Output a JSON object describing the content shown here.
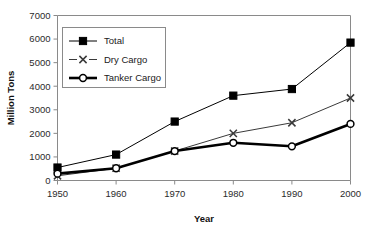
{
  "chart_data": {
    "type": "line",
    "title": "",
    "xlabel": "Year",
    "ylabel": "Million Tons",
    "x": [
      1950,
      1960,
      1970,
      1980,
      1990,
      2000
    ],
    "xticklabels": [
      "1950",
      "1960",
      "1970",
      "1980",
      "1990",
      "2000"
    ],
    "yticklabels": [
      "0",
      "1000",
      "2000",
      "3000",
      "4000",
      "5000",
      "6000",
      "7000"
    ],
    "yticks": [
      0,
      1000,
      2000,
      3000,
      4000,
      5000,
      6000,
      7000
    ],
    "xlim": [
      1950,
      2000
    ],
    "ylim": [
      0,
      7000
    ],
    "grid": false,
    "legend_position": "upper-left-inside",
    "series": [
      {
        "name": "Total",
        "values": [
          550,
          1100,
          2500,
          3600,
          3880,
          5850
        ],
        "marker": "filled-square",
        "color": "#000000",
        "linestyle": "solid",
        "linewidth": 1
      },
      {
        "name": "Dry Cargo",
        "values": [
          200,
          520,
          1250,
          2000,
          2450,
          3500
        ],
        "marker": "x",
        "color": "#3a3a3a",
        "linestyle": "solid",
        "linewidth": 1
      },
      {
        "name": "Tanker Cargo",
        "values": [
          290,
          520,
          1250,
          1600,
          1450,
          2400
        ],
        "marker": "open-circle",
        "color": "#000000",
        "linestyle": "solid",
        "linewidth": 2.6
      }
    ]
  },
  "axes": {
    "ylabel": "Million Tons",
    "xlabel": "Year"
  },
  "legend": {
    "entries": [
      {
        "label": "Total"
      },
      {
        "label": "Dry Cargo"
      },
      {
        "label": "Tanker Cargo"
      }
    ]
  }
}
